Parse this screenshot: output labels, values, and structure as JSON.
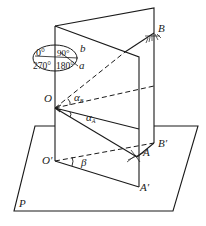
{
  "diagram": {
    "type": "geometry-3d-figure",
    "points": {
      "O": "O",
      "O_prime": "O′",
      "A": "A",
      "A_prime": "A′",
      "B": "B",
      "B_prime": "B′",
      "a": "a",
      "b": "b",
      "P": "P"
    },
    "angles": {
      "alpha_B": "α",
      "alpha_B_sub": "B",
      "alpha_A": "α",
      "alpha_A_sub": "A",
      "beta": "β"
    },
    "dial": {
      "top_left": "0°",
      "top_right": "90°",
      "bottom_left": "270°",
      "bottom_right": "180°"
    },
    "colors": {
      "line": "#1a1a1a",
      "background": "#ffffff"
    }
  }
}
